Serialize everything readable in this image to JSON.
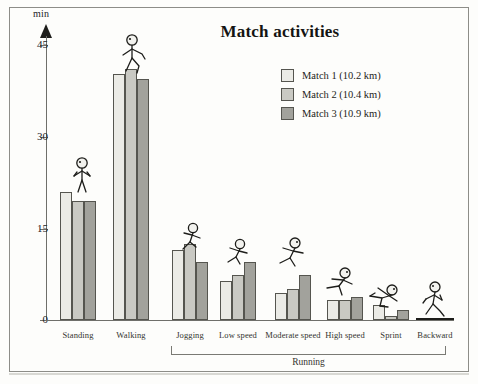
{
  "chart_data": {
    "type": "bar",
    "title": "Match activities",
    "xlabel": "",
    "ylabel": "min",
    "ylim": [
      0,
      48
    ],
    "yticks": [
      0,
      15,
      30,
      45
    ],
    "grid": false,
    "legend_position": "top-right",
    "categories": [
      "Standing",
      "Walking",
      "Jogging",
      "Low speed",
      "Moderate speed",
      "High speed",
      "Sprint",
      "Backward"
    ],
    "group_label": "Running",
    "group_label_span": [
      "Jogging",
      "Backward"
    ],
    "series": [
      {
        "name": "Match 1 (10.2 km)",
        "color": "#ebebe6",
        "values": [
          21.0,
          40.2,
          11.5,
          6.4,
          4.5,
          3.2,
          2.4,
          0.2
        ]
      },
      {
        "name": "Match 2 (10.4 km)",
        "color": "#c9c9c3",
        "values": [
          19.5,
          41.0,
          12.4,
          7.3,
          5.0,
          3.2,
          0.6,
          0.2
        ]
      },
      {
        "name": "Match 3 (10.9 km)",
        "color": "#a2a29c",
        "values": [
          19.5,
          39.5,
          9.5,
          9.5,
          7.3,
          3.7,
          1.6,
          0.2
        ]
      }
    ]
  },
  "axis": {
    "unit_label": "min",
    "tick_labels": [
      "45",
      "30",
      "15",
      "0"
    ]
  },
  "legend": {
    "items": [
      {
        "label": "Match 1 (10.2 km)"
      },
      {
        "label": "Match 2 (10.4 km)"
      },
      {
        "label": "Match 3 (10.9 km)"
      }
    ]
  },
  "figures": [
    {
      "name": "standing-figure"
    },
    {
      "name": "walking-figure"
    },
    {
      "name": "jogging-figure"
    },
    {
      "name": "low-speed-running-figure"
    },
    {
      "name": "moderate-speed-running-figure"
    },
    {
      "name": "high-speed-running-figure"
    },
    {
      "name": "sprint-figure"
    },
    {
      "name": "backward-running-figure"
    }
  ]
}
